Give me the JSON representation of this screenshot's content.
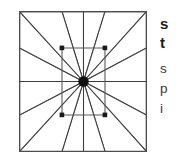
{
  "figure": {
    "caption_alt": "eight-pointed star geometric block",
    "frame": {
      "stroke": "#4d4d4d",
      "fill": "#ffffff",
      "x": 19,
      "y": 11,
      "width": 128,
      "height": 141
    },
    "grid": {
      "vertical_lines": [
        43,
        86
      ],
      "horizontal_lines": [
        37,
        104
      ],
      "stroke": "#4d4d4d"
    },
    "hub": {
      "cx": 64.5,
      "cy": 70.5,
      "r": 5.2,
      "color": "#111111",
      "label": "center-hub"
    },
    "star": {
      "points": 8,
      "outer_tips": [
        {
          "name": "tip-north",
          "x": 64.5,
          "y": 0
        },
        {
          "name": "tip-northeast",
          "x": 128,
          "y": 0
        },
        {
          "name": "tip-east",
          "x": 128,
          "y": 70.5
        },
        {
          "name": "tip-southeast",
          "x": 128,
          "y": 141
        },
        {
          "name": "tip-south",
          "x": 64.5,
          "y": 141
        },
        {
          "name": "tip-southwest",
          "x": 0,
          "y": 141
        },
        {
          "name": "tip-west",
          "x": 0,
          "y": 70.5
        },
        {
          "name": "tip-northwest",
          "x": 0,
          "y": 0
        }
      ],
      "stroke": "#3d3d3d",
      "fill": "#ffffff",
      "spoke_count": 16
    },
    "corner_nodes": [
      {
        "name": "node-top-left",
        "x": 43,
        "y": 37
      },
      {
        "name": "node-top-right",
        "x": 86,
        "y": 37
      },
      {
        "name": "node-bottom-right",
        "x": 86,
        "y": 104
      },
      {
        "name": "node-bottom-left",
        "x": 43,
        "y": 104
      }
    ]
  },
  "text_column": {
    "heading": [
      "s",
      "t"
    ],
    "body": [
      "s",
      "p",
      "i"
    ]
  }
}
